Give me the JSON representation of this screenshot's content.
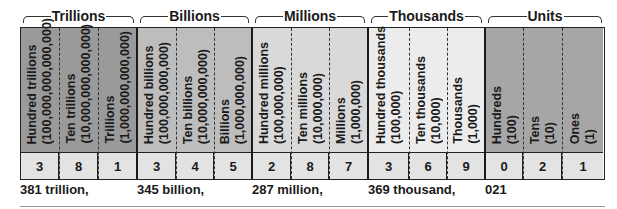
{
  "groups": [
    {
      "label": "Trillions",
      "color": "#9a9a9a",
      "readout": "381 trillion,",
      "places": [
        {
          "name": "Hundred trillions",
          "value": "(100,000,000,000,000)",
          "digit": "3"
        },
        {
          "name": "Ten trillions",
          "value": "(10,000,000,000,000)",
          "digit": "8"
        },
        {
          "name": "Trillions",
          "value": "(1,000,000,000,000)",
          "digit": "1"
        }
      ]
    },
    {
      "label": "Billions",
      "color": "#bdbdbd",
      "readout": "345 billion,",
      "places": [
        {
          "name": "Hundred billions",
          "value": "(100,000,000,000)",
          "digit": "3"
        },
        {
          "name": "Ten billions",
          "value": "(10,000,000,000)",
          "digit": "4"
        },
        {
          "name": "Billions",
          "value": "(1,000,000,000)",
          "digit": "5"
        }
      ]
    },
    {
      "label": "Millions",
      "color": "#d9d9d9",
      "readout": "287 million,",
      "places": [
        {
          "name": "Hundred millions",
          "value": "(100,000,000)",
          "digit": "2"
        },
        {
          "name": "Ten millions",
          "value": "(10,000,000)",
          "digit": "8"
        },
        {
          "name": "Millions",
          "value": "(1,000,000)",
          "digit": "7"
        }
      ]
    },
    {
      "label": "Thousands",
      "color": "#ececec",
      "readout": "369 thousand,",
      "places": [
        {
          "name": "Hundred thousands",
          "value": "(100,000)",
          "digit": "3"
        },
        {
          "name": "Ten thousands",
          "value": "(10,000)",
          "digit": "6"
        },
        {
          "name": "Thousands",
          "value": "(1,000)",
          "digit": "9"
        }
      ]
    },
    {
      "label": "Units",
      "color": "#a6a6a6",
      "readout": "021",
      "places": [
        {
          "name": "Hundreds",
          "value": "(100)",
          "digit": "0"
        },
        {
          "name": "Tens",
          "value": "(10)",
          "digit": "2"
        },
        {
          "name": "Ones",
          "value": "(1)",
          "digit": "1"
        }
      ]
    }
  ]
}
